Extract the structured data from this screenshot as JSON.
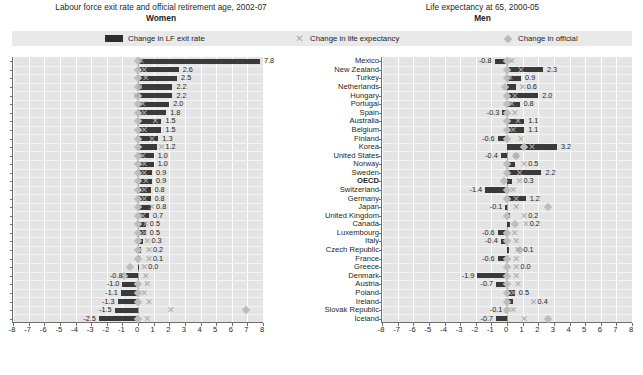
{
  "titles": {
    "left_main": "Labour force exit rate and official retirement age, 2002-07",
    "left_sub": "Women",
    "right_main": "Life expectancy at 65, 2000-05",
    "right_sub": "Men"
  },
  "legend": {
    "item1": "Change in LF exit rate",
    "item2": "Change in life expectancy",
    "item3": "Change in official",
    "bar_color": "#2e2e2e",
    "x_color": "#a9a9a9",
    "diamond_color": "#b9b9b9"
  },
  "chart_data": {
    "type": "bar",
    "orientation": "horizontal",
    "xlabel": "",
    "ylabel": "",
    "xlim": [
      -8,
      8
    ],
    "xticks": [
      -8,
      -7,
      -6,
      -5,
      -4,
      -3,
      -2,
      -1,
      0,
      1,
      2,
      3,
      4,
      5,
      6,
      7,
      8
    ],
    "grid": true,
    "legend_position": "top",
    "categories": [
      "Mexico",
      "New Zealand",
      "Turkey",
      "Netherlands",
      "Hungary",
      "Portugal",
      "Spain",
      "Australia",
      "Belgium",
      "Finland",
      "Korea",
      "United States",
      "Norway",
      "Sweden",
      "OECD",
      "Switzerland",
      "Germany",
      "Japan",
      "United Kingdom",
      "Canada",
      "Luxembourg",
      "Italy",
      "Czech Republic",
      "France",
      "Greece",
      "Denmark",
      "Austria",
      "Poland",
      "Ireland",
      "Slovak Republic",
      "Iceland"
    ],
    "bold_categories": [
      "OECD"
    ],
    "panels": [
      {
        "name": "women",
        "title": "Labour force exit rate and official retirement age, 2002-07",
        "subtitle": "Women",
        "series": [
          {
            "name": "Change in LF exit rate",
            "type": "bar",
            "values": [
              7.8,
              2.6,
              2.5,
              2.2,
              2.2,
              2.0,
              1.8,
              1.5,
              1.5,
              1.3,
              1.2,
              1.0,
              1.0,
              0.9,
              0.9,
              0.8,
              0.8,
              0.8,
              0.7,
              0.5,
              0.5,
              0.3,
              0.2,
              0.1,
              0.0,
              -0.8,
              -1.0,
              -1.1,
              -1.3,
              -1.5,
              -2.5
            ],
            "labels": [
              "7.8",
              "2.6",
              "2.5",
              "2.2",
              "2.2",
              "2.0",
              "1.8",
              "1.5",
              "1.5",
              "1.3",
              "1.2",
              "1.0",
              "1.0",
              "0.9",
              "0.9",
              "0.8",
              "0.8",
              "0.8",
              "0.7",
              "0.5",
              "0.5",
              "0.3",
              "0.2",
              "0.1",
              "0.0",
              "-0.8",
              "-1.0",
              "-1.1",
              "-1.3",
              "-1.5",
              "-2.5"
            ]
          },
          {
            "name": "Change in life expectancy",
            "type": "marker-x",
            "values": [
              0.2,
              0.4,
              0.5,
              0.1,
              -0.1,
              0.3,
              0.4,
              1.1,
              0.4,
              0.9,
              1.5,
              0.3,
              0.4,
              0.4,
              0.5,
              0.4,
              0.4,
              0.9,
              0.3,
              0.5,
              0.4,
              0.6,
              0.7,
              0.7,
              0.4,
              0.5,
              0.6,
              0.4,
              0.7,
              2.1,
              0.6
            ]
          },
          {
            "name": "Change in official",
            "type": "marker-diamond",
            "values": [
              0.0,
              0.0,
              0.0,
              0.0,
              0.0,
              0.0,
              0.0,
              0.0,
              0.0,
              0.0,
              0.0,
              0.0,
              0.0,
              0.0,
              0.0,
              0.0,
              0.0,
              0.0,
              0.0,
              0.0,
              0.0,
              0.0,
              0.0,
              0.0,
              -0.5,
              -0.9,
              0.0,
              0.0,
              0.0,
              6.9,
              0.0
            ]
          }
        ]
      },
      {
        "name": "men",
        "title": "Life expectancy at 65, 2000-05",
        "subtitle": "Men",
        "series": [
          {
            "name": "Change in LF exit rate",
            "type": "bar",
            "values": [
              -0.8,
              2.3,
              0.9,
              0.6,
              2.0,
              0.8,
              -0.3,
              1.1,
              1.1,
              -0.6,
              3.2,
              -0.4,
              0.5,
              2.2,
              0.3,
              -1.4,
              1.2,
              -0.1,
              0.2,
              0.2,
              -0.6,
              -0.4,
              0.1,
              -0.6,
              0.0,
              -1.9,
              -0.7,
              0.5,
              0.4,
              -0.1,
              -0.7
            ],
            "labels": [
              "-0.8",
              "2.3",
              "0.9",
              "0.6",
              "2.0",
              "0.8",
              "-0.3",
              "1.1",
              "1.1",
              "-0.6",
              "3.2",
              "-0.4",
              "0.5",
              "2.2",
              "0.3",
              "-1.4",
              "1.2",
              "-0.1",
              "0.2",
              "0.2",
              "-0.6",
              "-0.4",
              "0.1",
              "-0.6",
              "0.0",
              "-1.9",
              "-0.7",
              "0.5",
              "0.4",
              "-0.1",
              "-0.7"
            ]
          },
          {
            "name": "Change in life expectancy",
            "type": "marker-x",
            "values": [
              0.3,
              0.9,
              0.2,
              1.0,
              0.5,
              0.3,
              0.5,
              0.7,
              0.4,
              0.9,
              1.6,
              0.6,
              1.1,
              0.8,
              0.8,
              0.4,
              0.6,
              0.6,
              1.1,
              1.2,
              0.5,
              0.6,
              0.7,
              0.6,
              0.6,
              0.6,
              0.7,
              0.4,
              1.7,
              0.4,
              1.1
            ]
          },
          {
            "name": "Change in official",
            "type": "marker-diamond",
            "values": [
              0.0,
              0.0,
              0.0,
              -0.1,
              0.0,
              0.0,
              0.0,
              0.0,
              0.0,
              0.0,
              1.1,
              0.6,
              0.0,
              0.0,
              -0.2,
              0.0,
              0.0,
              2.6,
              0.0,
              0.5,
              0.0,
              0.0,
              0.8,
              0.0,
              0.0,
              0.0,
              0.0,
              0.0,
              0.0,
              0.0,
              2.6
            ]
          }
        ]
      }
    ]
  }
}
